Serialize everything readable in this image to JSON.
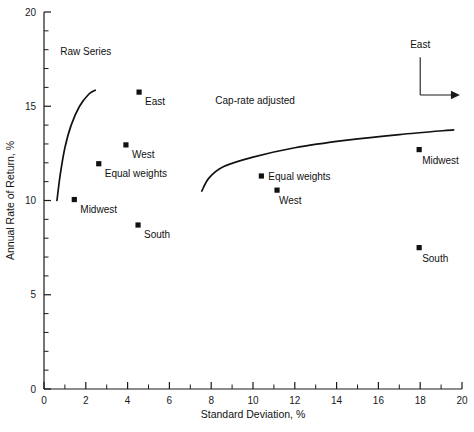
{
  "chart_data": {
    "type": "scatter",
    "title": "",
    "xlabel": "Standard Deviation, %",
    "ylabel": "Annual Rate of Return, %",
    "xlim": [
      0,
      20
    ],
    "ylim": [
      0,
      20
    ],
    "x_ticks_major": [
      0,
      2,
      4,
      6,
      8,
      10,
      12,
      14,
      16,
      18,
      20
    ],
    "x_tick_labels": [
      "0",
      "2",
      "4",
      "6",
      "8",
      "10",
      "12",
      "14",
      "16",
      "18",
      "20"
    ],
    "x_tick_minor_step": 1,
    "y_ticks_major": [
      0,
      5,
      10,
      15,
      20
    ],
    "y_tick_labels": [
      "0",
      "5",
      "10",
      "15",
      "20"
    ],
    "y_tick_minor_step": 1,
    "grid": false,
    "legend_position": "none",
    "groups": [
      {
        "name": "Raw Series",
        "label": "Raw Series",
        "label_x": 2.0,
        "label_y": 17.7,
        "frontier": {
          "name": "raw-series-frontier",
          "points": [
            [
              0.62,
              10.0
            ],
            [
              0.78,
              11.4
            ],
            [
              1.0,
              12.8
            ],
            [
              1.3,
              14.0
            ],
            [
              1.7,
              15.0
            ],
            [
              2.15,
              15.65
            ],
            [
              2.45,
              15.85
            ]
          ]
        },
        "points": [
          {
            "label": "Midwest",
            "x": 1.45,
            "y": 10.05,
            "label_dx": 6,
            "label_dy": 13
          },
          {
            "label": "Equal weights",
            "x": 2.62,
            "y": 11.95,
            "label_dx": 6,
            "label_dy": 13
          },
          {
            "label": "West",
            "x": 3.92,
            "y": 12.95,
            "label_dx": 6,
            "label_dy": 13
          },
          {
            "label": "East",
            "x": 4.55,
            "y": 15.75,
            "label_dx": 6,
            "label_dy": 13
          },
          {
            "label": "South",
            "x": 4.5,
            "y": 8.7,
            "label_dx": 6,
            "label_dy": 13
          }
        ]
      },
      {
        "name": "Cap-rate adjusted",
        "label": "Cap-rate adjusted",
        "label_x": 10.1,
        "label_y": 15.1,
        "frontier": {
          "name": "cap-rate-adjusted-frontier",
          "points": [
            [
              7.55,
              10.5
            ],
            [
              7.9,
              11.2
            ],
            [
              8.6,
              11.8
            ],
            [
              10.0,
              12.3
            ],
            [
              12.0,
              12.8
            ],
            [
              14.5,
              13.2
            ],
            [
              17.0,
              13.5
            ],
            [
              19.6,
              13.75
            ]
          ]
        },
        "points": [
          {
            "label": "Equal weights",
            "x": 10.4,
            "y": 11.3,
            "label_dx": 7,
            "label_dy": 4
          },
          {
            "label": "West",
            "x": 11.15,
            "y": 10.55,
            "label_dx": 2,
            "label_dy": 14
          },
          {
            "label": "Midwest",
            "x": 17.95,
            "y": 12.7,
            "label_dx": 3,
            "label_dy": 14
          },
          {
            "label": "South",
            "x": 17.95,
            "y": 7.5,
            "label_dx": 3,
            "label_dy": 14
          }
        ]
      }
    ],
    "annotations": [
      {
        "name": "east-arrow-annotation",
        "label": "East",
        "label_x": 18.0,
        "label_y": 18.1,
        "vertical_from": [
          18.0,
          17.6
        ],
        "vertical_to": [
          18.0,
          15.6
        ],
        "horizontal_from": [
          18.0,
          15.6
        ],
        "horizontal_to": [
          19.9,
          15.6
        ],
        "arrow_head": "right"
      }
    ],
    "colors": {
      "axis": "#1a1a1a",
      "marker": "#111111",
      "curve": "#111111",
      "background": "#ffffff"
    }
  },
  "footer": {
    "smudge_text": ""
  }
}
